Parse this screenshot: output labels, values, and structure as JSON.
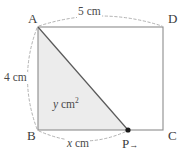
{
  "figure": {
    "kind": "geometry-diagram",
    "vertices": {
      "A": "A",
      "B": "B",
      "C": "C",
      "D": "D",
      "P": "P"
    },
    "dimensions": {
      "top": "5 cm",
      "left": "4 cm",
      "bottom": "x cm"
    },
    "area_label": {
      "variable": "y",
      "unit": "cm",
      "exponent": "2"
    },
    "point_marker": {
      "label": "P",
      "direction_arrow": "→"
    },
    "colors": {
      "shade_fill": "#ececec",
      "rectangle_stroke": "#8c8c8c",
      "hypotenuse_stroke": "#5a5a5a",
      "dash_stroke": "#a9a9a9",
      "text": "#4a4a4a",
      "point_dot": "#1a1a1a",
      "background": "#ffffff"
    },
    "geometry": {
      "rect": {
        "x": 38,
        "y": 27,
        "width": 125,
        "height": 103
      },
      "point_P": {
        "x": 128,
        "y": 130
      }
    }
  }
}
